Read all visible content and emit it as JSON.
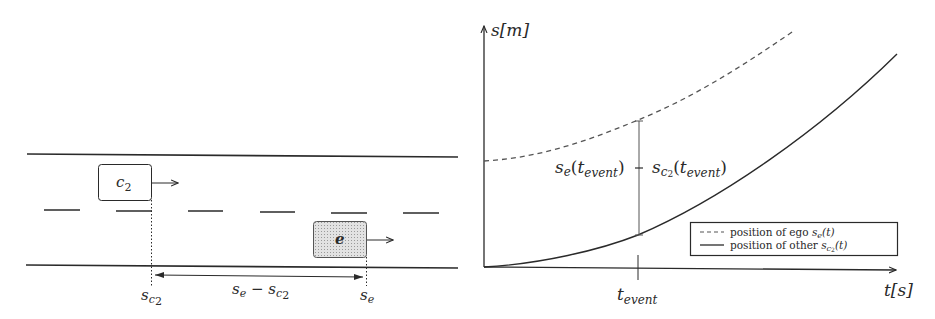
{
  "road_scene": {
    "other_vehicle": {
      "label": "c",
      "label_sub": "2"
    },
    "ego_vehicle": {
      "label": "e"
    },
    "marker_other": {
      "base": "s",
      "sub": "c",
      "subsub": "2"
    },
    "marker_ego": {
      "base": "s",
      "sub": "e"
    },
    "distance_label": {
      "a": "s",
      "a_sub": "e",
      "op": " − ",
      "b": "s",
      "b_sub": "c",
      "b_subsub": "2"
    }
  },
  "plot": {
    "y_axis_label": "s[m]",
    "x_axis_label": "t[s]",
    "event_tick_label": {
      "base": "t",
      "sub": "event"
    },
    "gap_annotation": {
      "left": {
        "base": "s",
        "sub": "e",
        "arg": "t",
        "arg_sub": "event"
      },
      "op": "−",
      "right": {
        "base": "s",
        "sub": "c",
        "subsub": "2",
        "arg": "t",
        "arg_sub": "event"
      }
    },
    "legend": [
      {
        "style": "dashed",
        "label": "position of ego ",
        "math": "s",
        "math_sub": "e",
        "math_arg": "(t)"
      },
      {
        "style": "solid",
        "label": "position of other ",
        "math": "s",
        "math_sub": "c",
        "math_subsub": "2",
        "math_arg": "(t)"
      }
    ]
  },
  "colors": {
    "ink": "#2a2a2a",
    "ego_fill": "#d6d6d6",
    "dashed_line": "#555555"
  }
}
